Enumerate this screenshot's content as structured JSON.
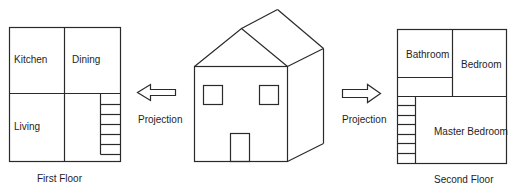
{
  "first_floor": {
    "caption": "First Floor",
    "rooms": [
      {
        "label": "Kitchen"
      },
      {
        "label": "Dining"
      },
      {
        "label": "Living"
      }
    ],
    "stairs_steps": 6
  },
  "house": {
    "windows": 2,
    "doors": 1
  },
  "arrows": {
    "left_label": "Projection",
    "right_label": "Projection"
  },
  "second_floor": {
    "caption": "Second Floor",
    "rooms": [
      {
        "label": "Bathroom"
      },
      {
        "label": "Bedroom"
      },
      {
        "label": "Master Bedroom"
      }
    ],
    "stairs_steps": 7
  },
  "colors": {
    "line": "#2a2a2a",
    "text": "#1e1e1e",
    "background": "#ffffff"
  }
}
